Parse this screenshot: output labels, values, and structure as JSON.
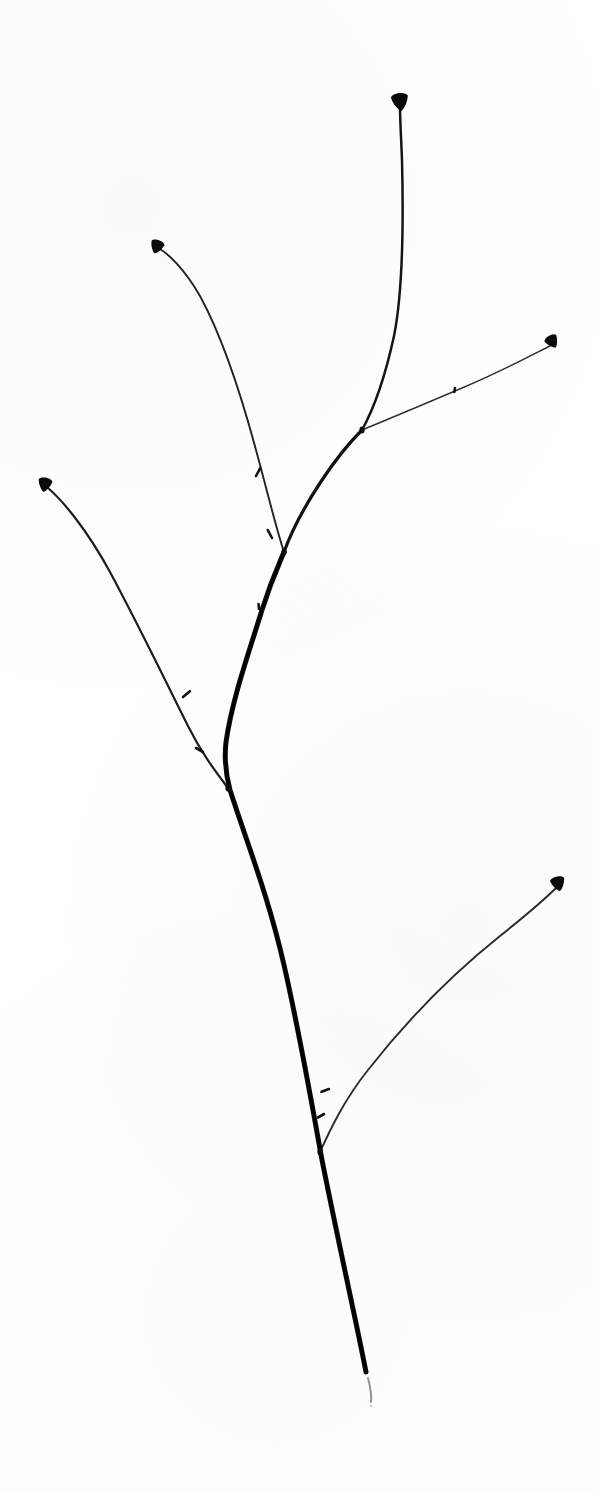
{
  "image": {
    "title": "Bare twig botanical specimen",
    "subject": "woody twig with terminal and lateral buds",
    "width": 599,
    "height": 1493,
    "background_color": "#fefefe",
    "ink_color": "#111111",
    "faint_ink_color": "#5a5a5a",
    "style": "high-contrast line scan on white ground",
    "caption": ""
  },
  "structure": {
    "terminal_bud_count": 5,
    "junction_count": 4,
    "lateral_bud_count": 8,
    "cut_end_label": "cut stem base"
  },
  "geometry": {
    "trunk": {
      "name": "main-stem",
      "path": "M 366 1372 C 358 1330 340 1250 322 1160 C 312 1105 300 1035 284 965 C 268 895 246 840 230 790 C 226 775 224 760 226 742 C 232 700 248 655 262 610 C 272 578 280 562 284 552",
      "width_base": 5.6,
      "width_tip": 3.4
    },
    "segments": [
      {
        "name": "stem-upper-to-fork2",
        "path": "M 284 552 C 292 530 306 504 322 480 C 338 456 352 440 362 430",
        "width_base": 3.4,
        "width_tip": 2.6,
        "color": "#111111"
      },
      {
        "name": "leader-to-top-bud",
        "path": "M 362 430 C 372 412 384 382 394 336 C 402 296 404 240 402 160 C 401 135 400 118 400 108",
        "width_base": 2.6,
        "width_tip": 1.5,
        "color": "#141414"
      },
      {
        "name": "branch-upper-right",
        "path": "M 362 430 C 386 420 420 406 462 388 C 500 372 534 354 550 346",
        "width_base": 1.8,
        "width_tip": 1.0,
        "color": "#4a4a4a"
      },
      {
        "name": "branch-upper-left",
        "path": "M 284 552 C 276 528 268 494 256 450 C 242 398 224 340 200 296 C 184 268 168 254 160 249",
        "width_base": 2.2,
        "width_tip": 1.1,
        "color": "#2a2a2a"
      },
      {
        "name": "branch-mid-left",
        "path": "M 228 788 C 216 772 202 754 188 726 C 168 686 140 628 110 572 C 86 528 62 500 48 488",
        "width_base": 2.6,
        "width_tip": 1.2,
        "color": "#222222"
      },
      {
        "name": "branch-lower-right",
        "path": "M 320 1152 C 330 1130 344 1100 368 1070 C 404 1024 450 976 500 936 C 530 912 548 896 556 888",
        "width_base": 2.4,
        "width_tip": 1.1,
        "color": "#333333"
      }
    ],
    "terminal_buds": [
      {
        "name": "bud-top",
        "cx": 400,
        "cy": 101,
        "rx": 8.5,
        "ry": 8.0,
        "rot": -8
      },
      {
        "name": "bud-upper-left",
        "cx": 157,
        "cy": 246,
        "rx": 6.8,
        "ry": 6.2,
        "rot": 18
      },
      {
        "name": "bud-upper-right",
        "cx": 552,
        "cy": 341,
        "rx": 6.6,
        "ry": 6.0,
        "rot": -30
      },
      {
        "name": "bud-left",
        "cx": 45,
        "cy": 484,
        "rx": 7.0,
        "ry": 6.4,
        "rot": 10
      },
      {
        "name": "bud-lower-right",
        "cx": 558,
        "cy": 883,
        "rx": 7.2,
        "ry": 6.6,
        "rot": -14
      }
    ],
    "lateral_buds": [
      {
        "name": "lateral-bud-a",
        "x": 256,
        "y": 476,
        "angle": -62,
        "len": 9
      },
      {
        "name": "lateral-bud-b",
        "x": 272,
        "y": 538,
        "angle": -118,
        "len": 9
      },
      {
        "name": "lateral-bud-c",
        "x": 183,
        "y": 697,
        "angle": -40,
        "len": 9
      },
      {
        "name": "lateral-bud-d",
        "x": 203,
        "y": 752,
        "angle": -150,
        "len": 8
      },
      {
        "name": "lateral-bud-e",
        "x": 329,
        "y": 1089,
        "angle": 160,
        "len": 8
      },
      {
        "name": "lateral-bud-f",
        "x": 324,
        "y": 1114,
        "angle": 150,
        "len": 7
      },
      {
        "name": "lateral-bud-g",
        "x": 455,
        "y": 388,
        "angle": 100,
        "len": 4
      },
      {
        "name": "lateral-bud-h",
        "x": 259,
        "y": 609,
        "angle": -95,
        "len": 5
      }
    ],
    "junctions": [
      {
        "name": "fork-top",
        "cx": 362,
        "cy": 430
      },
      {
        "name": "fork-upper",
        "cx": 284,
        "cy": 552
      },
      {
        "name": "fork-mid",
        "cx": 228,
        "cy": 788
      },
      {
        "name": "fork-lower",
        "cx": 320,
        "cy": 1152
      }
    ],
    "cut_end": {
      "name": "stem-cut-end",
      "x": 366,
      "y": 1372,
      "smudge_path": "M 368 1378 C 370 1386 372 1394 371 1402"
    }
  }
}
